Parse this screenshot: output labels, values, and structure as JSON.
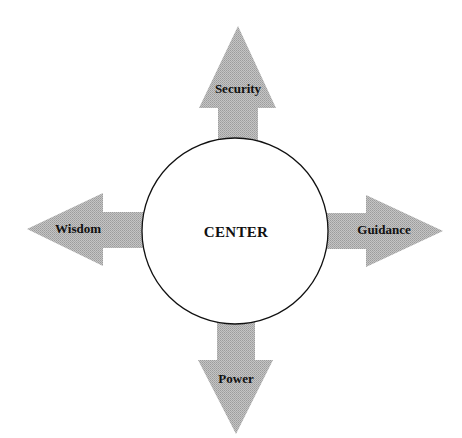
{
  "diagram": {
    "center": {
      "label": "CENTER"
    },
    "arrows": [
      {
        "direction": "up",
        "label": "Security"
      },
      {
        "direction": "left",
        "label": "Wisdom"
      },
      {
        "direction": "right",
        "label": "Guidance"
      },
      {
        "direction": "down",
        "label": "Power"
      }
    ]
  },
  "colors": {
    "arrow_fill": "#b4b4b4",
    "circle_stroke": "#111111",
    "circle_fill": "#ffffff",
    "text": "#111111"
  }
}
